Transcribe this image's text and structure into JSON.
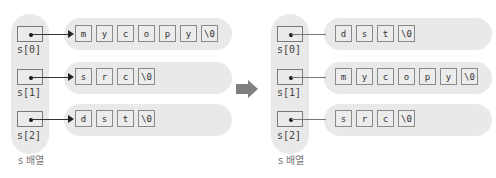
{
  "left": {
    "caption": "s 배열",
    "pointers": [
      {
        "label": "s[0]",
        "chars": [
          "m",
          "y",
          "c",
          "o",
          "p",
          "y",
          "\\0"
        ]
      },
      {
        "label": "s[1]",
        "chars": [
          "s",
          "r",
          "c",
          "\\0"
        ]
      },
      {
        "label": "s[2]",
        "chars": [
          "d",
          "s",
          "t",
          "\\0"
        ]
      }
    ]
  },
  "right": {
    "caption": "s 배열",
    "pointers": [
      {
        "label": "s[0]",
        "chars": [
          "d",
          "s",
          "t",
          "\\0"
        ]
      },
      {
        "label": "s[1]",
        "chars": [
          "m",
          "y",
          "c",
          "o",
          "p",
          "y",
          "\\0"
        ]
      },
      {
        "label": "s[2]",
        "chars": [
          "s",
          "r",
          "c",
          "\\0"
        ]
      }
    ]
  },
  "colors": {
    "pill": "#e9e9e9",
    "arrow": "#808080"
  },
  "transition_icon": "right-arrow-icon"
}
